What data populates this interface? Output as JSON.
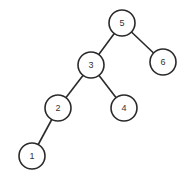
{
  "diagram": {
    "type": "binary-tree",
    "nodes": [
      {
        "id": "n5",
        "label": "5",
        "x": 122,
        "y": 23
      },
      {
        "id": "n3",
        "label": "3",
        "x": 91,
        "y": 65
      },
      {
        "id": "n6",
        "label": "6",
        "x": 163,
        "y": 62
      },
      {
        "id": "n2",
        "label": "2",
        "x": 58,
        "y": 108
      },
      {
        "id": "n4",
        "label": "4",
        "x": 124,
        "y": 108
      },
      {
        "id": "n1",
        "label": "1",
        "x": 32,
        "y": 156
      }
    ],
    "edges": [
      {
        "from": "n5",
        "to": "n3"
      },
      {
        "from": "n5",
        "to": "n6"
      },
      {
        "from": "n3",
        "to": "n2"
      },
      {
        "from": "n3",
        "to": "n4"
      },
      {
        "from": "n2",
        "to": "n1"
      }
    ],
    "node_radius": 13,
    "colors": {
      "stroke": "#2a2a2a",
      "fill": "#ffffff",
      "text": "#333333"
    }
  }
}
